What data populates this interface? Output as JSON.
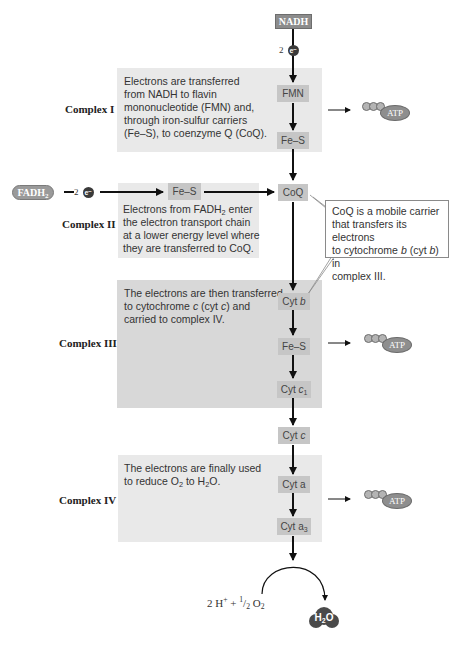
{
  "start": {
    "nadh_label": "NADH",
    "fadh2_label": "FADH",
    "fadh2_sub": "2",
    "electron_count": "2",
    "electron_symbol": "e⁻"
  },
  "complexes": [
    {
      "label": "Complex I",
      "text": [
        "Electrons are transferred",
        "from NADH to flavin",
        "mononucleotide (FMN) and,",
        "through iron-sulfur carriers",
        "(Fe–S), to coenzyme Q (CoQ)."
      ],
      "carriers": [
        "FMN",
        "Fe–S"
      ],
      "produces_atp": true
    },
    {
      "label": "Complex II",
      "text_parts": {
        "line1_pre": "Electrons from FADH",
        "line1_sub": "2",
        "line1_post": " enter",
        "line2": "the electron transport chain",
        "line3": "at a lower energy level where",
        "line4": "they are transferred to CoQ."
      },
      "carriers": [
        "Fe–S"
      ],
      "produces_atp": false
    },
    {
      "label": "Complex III",
      "text_parts": {
        "line1": "The electrons are then transferred",
        "line2_pre": "to cytochrome ",
        "line2_em1": "c",
        "line2_mid": " (cyt ",
        "line2_em2": "c",
        "line2_post": ") and",
        "line3": "carried to complex IV."
      },
      "carriers": {
        "cyt_b_pre": "Cyt ",
        "cyt_b_em": "b",
        "fes": "Fe–S",
        "cyt_c1_pre": "Cyt ",
        "cyt_c1_em": "c",
        "cyt_c1_sub": "1"
      },
      "produces_atp": true
    },
    {
      "label": "Complex IV",
      "text_parts": {
        "line1": "The electrons are finally used",
        "line2_pre": "to reduce O",
        "line2_sub1": "2",
        "line2_mid": " to H",
        "line2_sub2": "2",
        "line2_post": "O."
      },
      "carriers": {
        "cyt_a": "Cyt a",
        "cyt_a3_pre": "Cyt a",
        "cyt_a3_sub": "3"
      },
      "produces_atp": true
    }
  ],
  "shared_carriers": {
    "coq": "CoQ",
    "cyt_c_pre": "Cyt ",
    "cyt_c_em": "c"
  },
  "callout": {
    "line1": "CoQ is a mobile carrier",
    "line2": "that transfers its electrons",
    "line3_pre": "to cytochrome ",
    "line3_em1": "b",
    "line3_mid": " (cyt ",
    "line3_em2": "b",
    "line3_post": ") in",
    "line4": "complex III."
  },
  "atp_label": "ATP",
  "final_reaction": {
    "reactants_pre": "2 H",
    "reactants_sup": "+",
    "reactants_mid": " + ",
    "half_num": "1",
    "half_den": "2",
    "reactants_o": " O",
    "reactants_sub": "2",
    "product_pre": "H",
    "product_sub": "2",
    "product_post": "O"
  },
  "colors": {
    "panel_light": "#e9e9e9",
    "panel_dark": "#d8d8d8",
    "carrier_box": "#c6c6c6",
    "nadh_box": "#8c8c8c",
    "atp_oval": "#8e8e8e",
    "h2o_blob": "#4a4a4a",
    "arrow": "#111111"
  }
}
